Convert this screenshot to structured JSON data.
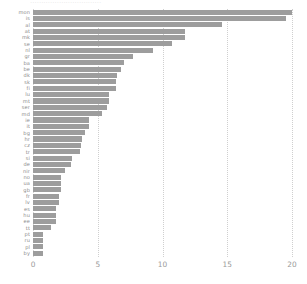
{
  "chart_data": {
    "type": "bar",
    "orientation": "horizontal",
    "title": "",
    "xlabel": "",
    "ylabel": "",
    "xlim": [
      0,
      20
    ],
    "grid": "vertical-dotted",
    "legend": "none",
    "bar_color": "#9d9d9d",
    "xticks": [
      "0",
      "5",
      "10",
      "15",
      "20"
    ],
    "xtick_values": [
      0,
      5,
      10,
      15,
      20
    ],
    "categories": [
      "mon",
      "is",
      "al",
      "at",
      "mk",
      "se",
      "nl",
      "gr",
      "ba",
      "be",
      "dk",
      "sk",
      "fi",
      "lu",
      "mt",
      "ser",
      "md",
      "ie",
      "it",
      "bg",
      "hr",
      "cz",
      "tr",
      "si",
      "de",
      "nir",
      "no",
      "ua",
      "gb",
      "fr",
      "lv",
      "es",
      "hu",
      "ee",
      "tt",
      "pt",
      "ru",
      "pl",
      "by"
    ],
    "values": [
      20.0,
      19.5,
      14.6,
      11.7,
      11.7,
      10.7,
      9.3,
      7.7,
      7.0,
      6.8,
      6.5,
      6.4,
      6.4,
      5.9,
      5.9,
      5.7,
      5.3,
      4.3,
      4.3,
      4.0,
      3.8,
      3.7,
      3.6,
      3.0,
      2.9,
      2.5,
      2.2,
      2.2,
      2.2,
      2.0,
      2.0,
      1.8,
      1.8,
      1.8,
      1.4,
      0.8,
      0.8,
      0.8,
      0.8
    ]
  },
  "axis": {
    "x_tick_labels": [
      "0",
      "5",
      "10",
      "15",
      "20"
    ]
  },
  "title_sliver": "································"
}
